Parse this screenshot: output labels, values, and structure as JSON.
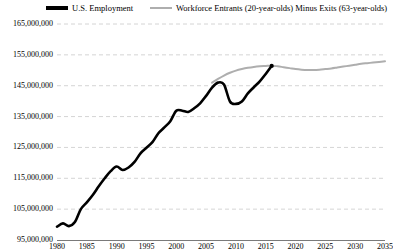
{
  "legend": {
    "entries": [
      {
        "label": "U.S. Employment",
        "color": "#000000",
        "style": "thick-solid"
      },
      {
        "label": "Workforce Entrants (20-year-olds) Minus Exits (63-year-olds)",
        "color": "#aeaeae",
        "style": "thin-solid"
      }
    ]
  },
  "chart_data": {
    "type": "line",
    "title": "",
    "xlabel": "",
    "ylabel": "",
    "xlim": [
      1980,
      2035
    ],
    "ylim": [
      95000000,
      165000000
    ],
    "grid": true,
    "grid_style": "dashed-horizontal",
    "legend_position": "top",
    "yticks": [
      95000000,
      105000000,
      115000000,
      125000000,
      135000000,
      145000000,
      155000000,
      165000000
    ],
    "ytick_labels": [
      "95,000,000",
      "105,000,000",
      "115,000,000",
      "125,000,000",
      "135,000,000",
      "145,000,000",
      "155,000,000",
      "165,000,000"
    ],
    "xticks": [
      1980,
      1985,
      1990,
      1995,
      2000,
      2005,
      2010,
      2015,
      2020,
      2025,
      2030,
      2035
    ],
    "xtick_labels": [
      "1980",
      "1985",
      "1990",
      "1995",
      "2000",
      "2005",
      "2010",
      "2015",
      "2020",
      "2025",
      "2030",
      "2035"
    ],
    "series": [
      {
        "name": "U.S. Employment",
        "color": "#000000",
        "width": 2.6,
        "marker_at_end": true,
        "x": [
          1980,
          1981,
          1982,
          1983,
          1984,
          1985,
          1986,
          1987,
          1988,
          1989,
          1990,
          1991,
          1992,
          1993,
          1994,
          1995,
          1996,
          1997,
          1998,
          1999,
          2000,
          2001,
          2002,
          2003,
          2004,
          2005,
          2006,
          2007,
          2008,
          2009,
          2010,
          2011,
          2012,
          2013,
          2014,
          2015,
          2016
        ],
        "y": [
          99300000,
          100400000,
          99500000,
          100800000,
          105000000,
          107200000,
          109600000,
          112400000,
          115000000,
          117300000,
          118800000,
          117700000,
          118500000,
          120300000,
          123100000,
          124900000,
          126700000,
          129600000,
          131500000,
          133500000,
          136900000,
          136900000,
          136500000,
          137700000,
          139300000,
          141700000,
          144400000,
          146000000,
          145400000,
          139900000,
          139100000,
          139900000,
          142500000,
          144500000,
          146400000,
          148800000,
          151400000
        ]
      },
      {
        "name": "Workforce Entrants (20-year-olds) Minus Exits (63-year-olds)",
        "color": "#aeaeae",
        "width": 2.0,
        "x": [
          2006,
          2007,
          2008,
          2009,
          2010,
          2011,
          2012,
          2013,
          2014,
          2015,
          2016,
          2017,
          2018,
          2019,
          2020,
          2021,
          2022,
          2023,
          2024,
          2025,
          2026,
          2027,
          2028,
          2029,
          2030,
          2031,
          2032,
          2033,
          2034,
          2035
        ],
        "y": [
          146000000,
          147200000,
          148300000,
          149200000,
          149900000,
          150400000,
          150800000,
          151100000,
          151300000,
          151400000,
          151500000,
          151300000,
          151000000,
          150700000,
          150400000,
          150200000,
          150100000,
          150100000,
          150200000,
          150400000,
          150600000,
          150900000,
          151200000,
          151500000,
          151800000,
          152100000,
          152300000,
          152500000,
          152700000,
          152900000
        ]
      }
    ]
  }
}
